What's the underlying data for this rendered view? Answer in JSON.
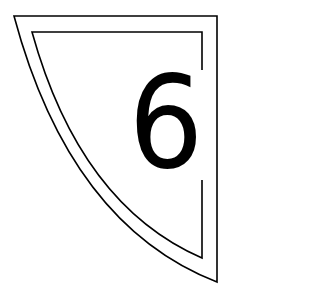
{
  "badge": {
    "number": "6",
    "stroke_color": "#000000",
    "background_color": "#ffffff"
  }
}
